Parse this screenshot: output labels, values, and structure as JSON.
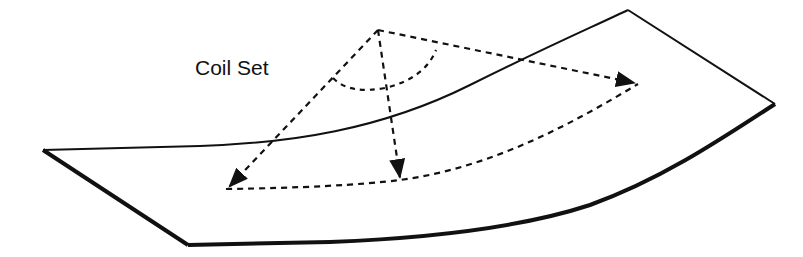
{
  "diagram": {
    "title_label": "Coil Set",
    "colors": {
      "stroke": "#111111",
      "background": "#ffffff"
    },
    "elements": {
      "sheet": "curved metal strip outline (coil set shape)",
      "arrows": [
        "left-front-arrow",
        "center-arrow",
        "right-back-arrow"
      ],
      "bottom_curve": "dashed curvature line",
      "angle_arc": "dashed arc indicating angle at apex"
    }
  }
}
